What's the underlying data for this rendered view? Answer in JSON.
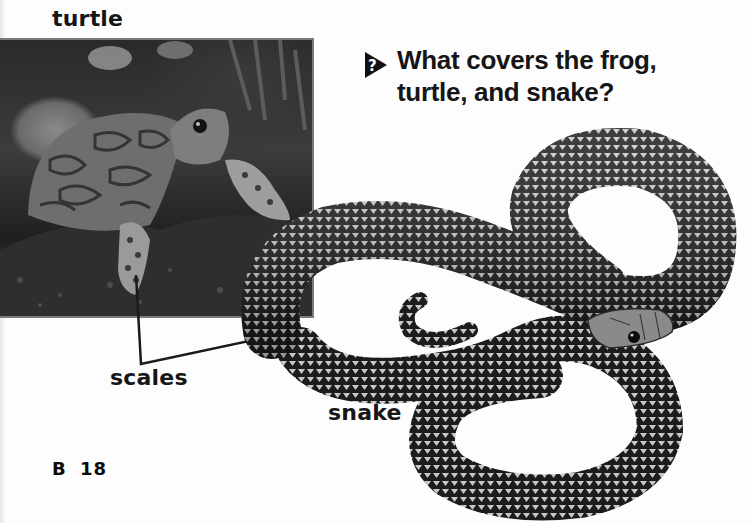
{
  "page": {
    "labels": {
      "turtle": "turtle",
      "scales": "scales",
      "snake": "snake"
    },
    "question": {
      "icon": "question-triangle-icon",
      "line1": "What covers the frog,",
      "line2": "turtle, and snake?"
    },
    "page_number": "B 18",
    "images": [
      {
        "name": "turtle-photo",
        "description": "Box turtle on mossy ground with leaves behind"
      },
      {
        "name": "snake-photo",
        "description": "Coiled snake with patterned scales"
      }
    ],
    "colors": {
      "background": "#fdfdfd",
      "text": "#151515",
      "photo_border": "#7a7a7a"
    }
  }
}
